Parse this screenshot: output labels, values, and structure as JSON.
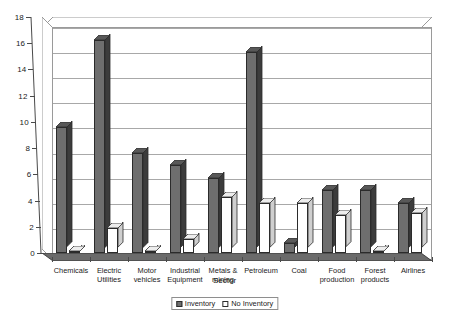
{
  "chart_data": {
    "type": "bar",
    "title": "",
    "xlabel": "Sector",
    "ylabel": "",
    "ylim": [
      0,
      18
    ],
    "ytick_step": 2,
    "yticks": [
      "0",
      "2",
      "4",
      "6",
      "8",
      "10",
      "12",
      "14",
      "16",
      "18"
    ],
    "grid": true,
    "legend_position": "bottom",
    "categories": [
      "Chemicals",
      "Electric Utilities",
      "Motor vehicles",
      "Industrial Equipment",
      "Metals & mining",
      "Petroleum",
      "Coal",
      "Food production",
      "Forest products",
      "Airlines"
    ],
    "category_lines": [
      [
        "Chemicals"
      ],
      [
        "Electric",
        "Utilities"
      ],
      [
        "Motor",
        "vehicles"
      ],
      [
        "Industrial",
        "Equipment"
      ],
      [
        "Metals &",
        "mining"
      ],
      [
        "Petroleum"
      ],
      [
        "Coal"
      ],
      [
        "Food",
        "production"
      ],
      [
        "Forest",
        "products"
      ],
      [
        "Airlines"
      ]
    ],
    "series": [
      {
        "name": "Inventory",
        "color": "#6e6e6e",
        "values": [
          10.0,
          17.0,
          8.0,
          7.0,
          6.0,
          16.0,
          0.8,
          5.0,
          5.0,
          4.0
        ]
      },
      {
        "name": "No Inventory",
        "color": "#ffffff",
        "values": [
          0.15,
          2.0,
          0.15,
          1.1,
          4.5,
          4.0,
          4.0,
          3.0,
          0.12,
          3.2
        ]
      }
    ]
  },
  "legend": {
    "items": [
      {
        "label": "Inventory"
      },
      {
        "label": "No Inventory"
      }
    ]
  }
}
